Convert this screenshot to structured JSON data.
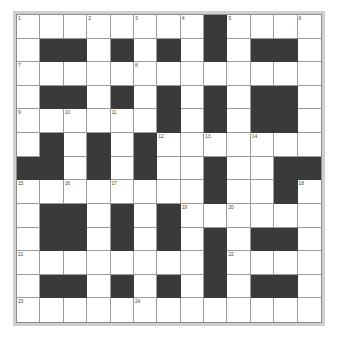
{
  "puzzle": {
    "title": "Crossword Grid",
    "type": "crossword",
    "rows": 13,
    "cols": 13,
    "colors": {
      "block": "#3a3a3a",
      "open": "#ffffff",
      "gridline": "#9a9a9a",
      "frame": "#cfcfcf",
      "number_text": "#4a4a4a"
    },
    "grid": [
      [
        "open",
        "open",
        "open",
        "open",
        "open",
        "open",
        "open",
        "open",
        "block",
        "open",
        "open",
        "open",
        "open"
      ],
      [
        "open",
        "block",
        "block",
        "open",
        "block",
        "open",
        "block",
        "open",
        "block",
        "open",
        "block",
        "block",
        "open"
      ],
      [
        "open",
        "open",
        "open",
        "open",
        "open",
        "open",
        "open",
        "open",
        "open",
        "open",
        "open",
        "open",
        "open"
      ],
      [
        "open",
        "block",
        "block",
        "open",
        "block",
        "open",
        "block",
        "open",
        "block",
        "open",
        "block",
        "block",
        "open"
      ],
      [
        "open",
        "open",
        "open",
        "open",
        "open",
        "open",
        "block",
        "open",
        "block",
        "open",
        "block",
        "block",
        "open"
      ],
      [
        "open",
        "block",
        "open",
        "block",
        "open",
        "block",
        "open",
        "open",
        "open",
        "open",
        "open",
        "open",
        "open"
      ],
      [
        "block",
        "block",
        "open",
        "block",
        "open",
        "block",
        "open",
        "open",
        "block",
        "open",
        "open",
        "block",
        "block"
      ],
      [
        "open",
        "open",
        "open",
        "open",
        "open",
        "open",
        "open",
        "open",
        "block",
        "open",
        "open",
        "block",
        "open"
      ],
      [
        "open",
        "block",
        "block",
        "open",
        "block",
        "open",
        "block",
        "open",
        "open",
        "open",
        "open",
        "open",
        "open"
      ],
      [
        "open",
        "block",
        "block",
        "open",
        "block",
        "open",
        "block",
        "open",
        "block",
        "open",
        "block",
        "block",
        "open"
      ],
      [
        "open",
        "open",
        "open",
        "open",
        "open",
        "open",
        "open",
        "open",
        "block",
        "open",
        "open",
        "open",
        "open"
      ],
      [
        "open",
        "block",
        "block",
        "open",
        "block",
        "open",
        "block",
        "open",
        "block",
        "open",
        "block",
        "block",
        "open"
      ],
      [
        "open",
        "open",
        "open",
        "open",
        "open",
        "open",
        "open",
        "open",
        "open",
        "open",
        "open",
        "open",
        "open"
      ]
    ],
    "numbers": [
      {
        "row": 0,
        "col": 0,
        "label": "1"
      },
      {
        "row": 0,
        "col": 3,
        "label": "2"
      },
      {
        "row": 0,
        "col": 5,
        "label": "3"
      },
      {
        "row": 0,
        "col": 7,
        "label": "4"
      },
      {
        "row": 0,
        "col": 9,
        "label": "5"
      },
      {
        "row": 0,
        "col": 12,
        "label": "6"
      },
      {
        "row": 2,
        "col": 0,
        "label": "7"
      },
      {
        "row": 2,
        "col": 5,
        "label": "8"
      },
      {
        "row": 4,
        "col": 0,
        "label": "9"
      },
      {
        "row": 4,
        "col": 2,
        "label": "10"
      },
      {
        "row": 4,
        "col": 4,
        "label": "11"
      },
      {
        "row": 5,
        "col": 6,
        "label": "12"
      },
      {
        "row": 5,
        "col": 8,
        "label": "13"
      },
      {
        "row": 5,
        "col": 10,
        "label": "14"
      },
      {
        "row": 7,
        "col": 0,
        "label": "15"
      },
      {
        "row": 7,
        "col": 2,
        "label": "16"
      },
      {
        "row": 7,
        "col": 4,
        "label": "17"
      },
      {
        "row": 7,
        "col": 12,
        "label": "18"
      },
      {
        "row": 8,
        "col": 7,
        "label": "19"
      },
      {
        "row": 8,
        "col": 9,
        "label": "20"
      },
      {
        "row": 10,
        "col": 0,
        "label": "21"
      },
      {
        "row": 10,
        "col": 9,
        "label": "22"
      },
      {
        "row": 12,
        "col": 0,
        "label": "23"
      },
      {
        "row": 12,
        "col": 5,
        "label": "24"
      }
    ]
  }
}
